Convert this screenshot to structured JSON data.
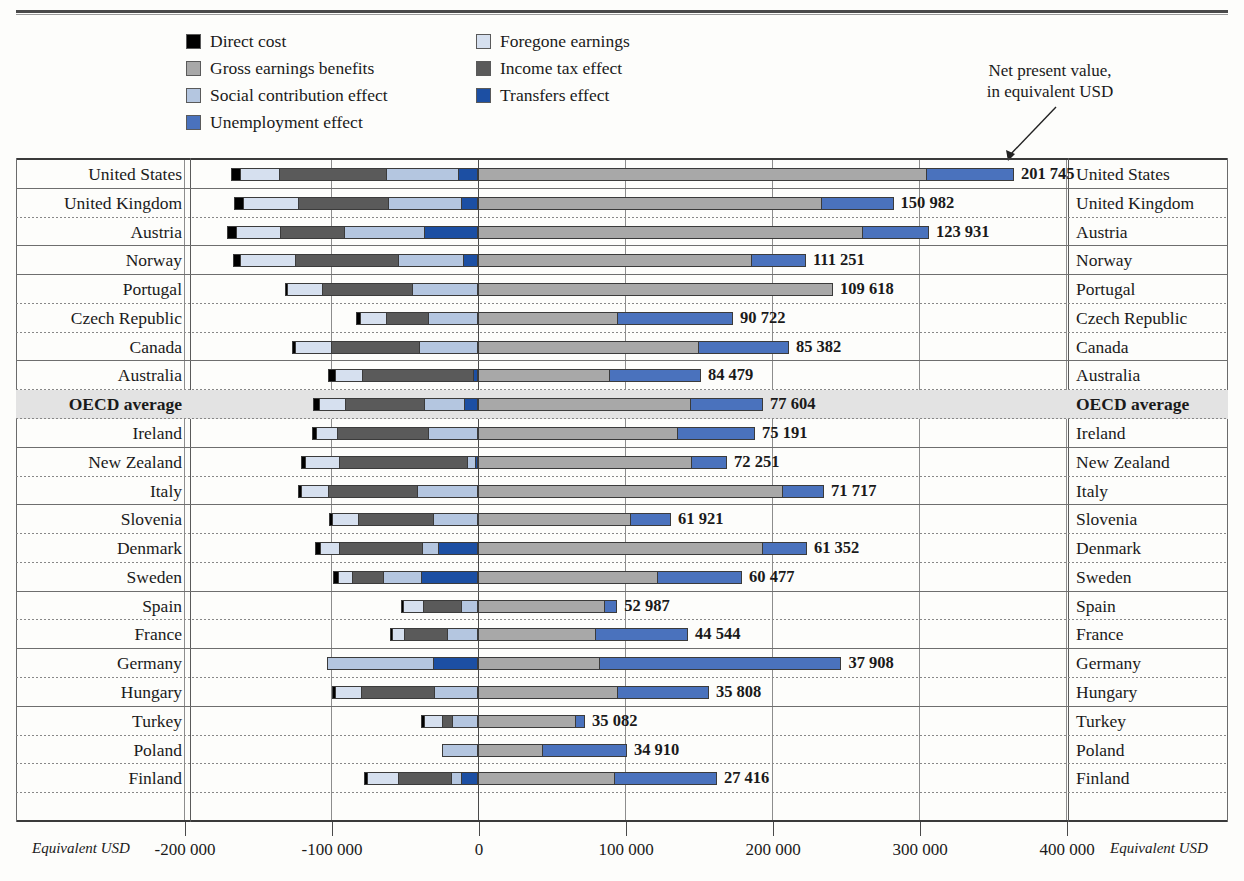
{
  "legend": {
    "items": [
      {
        "label": "Direct cost",
        "color": "#000000",
        "key": "direct_cost"
      },
      {
        "label": "Foregone earnings",
        "color": "#d6e0ef",
        "key": "foregone_earnings"
      },
      {
        "label": "Gross earnings benefits",
        "color": "#a8a8a8",
        "key": "gross_earnings_benefits"
      },
      {
        "label": "Income tax effect",
        "color": "#5a5a5a",
        "key": "income_tax_effect"
      },
      {
        "label": "Social contribution effect",
        "color": "#b4c6e0",
        "key": "social_contribution_effect"
      },
      {
        "label": "Transfers effect",
        "color": "#1c4fa3",
        "key": "transfers_effect"
      },
      {
        "label": "Unemployment effect",
        "color": "#4a72bd",
        "key": "unemployment_effect"
      }
    ]
  },
  "annotation": {
    "line1": "Net present value,",
    "line2": "in equivalent USD"
  },
  "axis": {
    "unit_left": "Equivalent USD",
    "unit_right": "Equivalent USD",
    "ticks": [
      "-200 000",
      "-100 000",
      "0",
      "100 000",
      "200 000",
      "300 000",
      "400 000"
    ],
    "tick_values": [
      -200000,
      -100000,
      0,
      100000,
      200000,
      300000,
      400000
    ]
  },
  "chart_data": {
    "type": "bar",
    "title": "",
    "xlabel": "Equivalent USD",
    "ylabel": "",
    "xlim": [
      -250000,
      430000
    ],
    "orientation": "horizontal",
    "stacked": true,
    "grid": true,
    "legend_position": "top",
    "categories": [
      "United States",
      "United Kingdom",
      "Austria",
      "Norway",
      "Portugal",
      "Czech Republic",
      "Canada",
      "Australia",
      "OECD average",
      "Ireland",
      "New Zealand",
      "Italy",
      "Slovenia",
      "Denmark",
      "Sweden",
      "Spain",
      "France",
      "Germany",
      "Hungary",
      "Turkey",
      "Poland",
      "Finland"
    ],
    "series": [
      {
        "name": "Transfers effect",
        "color": "#1c4fa3",
        "values": [
          -13600,
          -11500,
          -36600,
          -10200,
          0,
          0,
          0,
          0,
          -9500,
          0,
          -2000,
          0,
          0,
          -27200,
          -38800,
          0,
          0,
          -30600,
          0,
          0,
          0,
          -11600
        ]
      },
      {
        "name": "Social contribution effect",
        "color": "#b4c6e0",
        "values": [
          -62900,
          -60900,
          -91200,
          -54400,
          -44900,
          -33700,
          -39900,
          0,
          -36600,
          -33700,
          -7500,
          -41600,
          -30600,
          -38100,
          -64600,
          -11600,
          -21100,
          -102700,
          -29900,
          -17700,
          -24500,
          -18400
        ]
      },
      {
        "name": "Income tax effect",
        "color": "#5a5a5a",
        "values": [
          -135200,
          -122300,
          -134500,
          -124400,
          -106400,
          -62900,
          -99900,
          -78800,
          -90500,
          -95800,
          -94400,
          -102000,
          -81500,
          -94500,
          -85600,
          -37400,
          -50300,
          -68700,
          -79500,
          -24500,
          -9500,
          -54400
        ]
      },
      {
        "name": "Foregone earnings",
        "color": "#d6e0ef",
        "values": [
          -161600,
          -159600,
          -164300,
          -161600,
          -129700,
          -80200,
          -124400,
          -97200,
          -108400,
          -110400,
          -117700,
          -120400,
          -99300,
          -107800,
          -95100,
          -51000,
          -58500,
          -99300,
          -97200,
          -36700,
          -22500,
          -75400
        ]
      },
      {
        "name": "Direct cost",
        "color": "#000000",
        "values": [
          -168000,
          -166000,
          -170500,
          -166800,
          -131000,
          -82900,
          -126500,
          -102000,
          -112500,
          -113100,
          -120400,
          -122500,
          -101300,
          -111200,
          -98500,
          -52400,
          -60200,
          -102700,
          -99300,
          -38800,
          -24500,
          -77400
        ]
      },
      {
        "name": "Gross earnings benefits",
        "color": "#a8a8a8",
        "values": [
          305500,
          233700,
          261900,
          186400,
          241500,
          95200,
          150300,
          89800,
          144900,
          136100,
          145600,
          207500,
          104100,
          193900,
          122500,
          86600,
          80300,
          82900,
          95200,
          66700,
          44200,
          93100
        ]
      },
      {
        "name": "Unemployment effect",
        "color": "#4a72bd",
        "values": [
          64600,
          49000,
          44900,
          36700,
          0,
          78300,
          61200,
          61900,
          49000,
          52400,
          23800,
          27900,
          27200,
          29900,
          57100,
          8200,
          62600,
          164300,
          61900,
          6100,
          57100,
          69400
        ]
      }
    ],
    "net_values": [
      201745,
      150982,
      123931,
      111251,
      109618,
      90722,
      85382,
      84479,
      77604,
      75191,
      72251,
      71717,
      61921,
      61352,
      60477,
      52987,
      44544,
      37908,
      35808,
      35082,
      34910,
      27416
    ],
    "net_labels": [
      "201 745",
      "150 982",
      "123 931",
      "111 251",
      "109 618",
      "90 722",
      "85 382",
      "84 479",
      "77 604",
      "75 191",
      "72 251",
      "71 717",
      "61 921",
      "61 352",
      "60 477",
      "52 987",
      "44 544",
      "37 908",
      "35 808",
      "35 082",
      "34 910",
      "27 416"
    ],
    "highlight_category": "OECD average"
  },
  "rows": [
    {
      "label": "United States",
      "value": "201 745",
      "neg": [
        [
          "transfers",
          -13600
        ],
        [
          "social",
          -62900
        ],
        [
          "tax",
          -135200
        ],
        [
          "foregone",
          -161600
        ],
        [
          "direct",
          -168000
        ]
      ],
      "pos": [
        [
          "gross",
          305500
        ],
        [
          "unemp",
          364600
        ]
      ],
      "solid": true,
      "shaded": false,
      "bold": false
    },
    {
      "label": "United Kingdom",
      "value": "150 982",
      "neg": [
        [
          "transfers",
          -11500
        ],
        [
          "social",
          -60900
        ],
        [
          "tax",
          -122300
        ],
        [
          "foregone",
          -159600
        ],
        [
          "direct",
          -166000
        ]
      ],
      "pos": [
        [
          "gross",
          233700
        ],
        [
          "unemp",
          282700
        ]
      ],
      "solid": false,
      "shaded": false,
      "bold": false
    },
    {
      "label": "Austria",
      "value": "123 931",
      "neg": [
        [
          "transfers",
          -36600
        ],
        [
          "social",
          -91200
        ],
        [
          "tax",
          -134500
        ],
        [
          "foregone",
          -164300
        ],
        [
          "direct",
          -170500
        ]
      ],
      "pos": [
        [
          "gross",
          261900
        ],
        [
          "unemp",
          306800
        ]
      ],
      "solid": true,
      "shaded": false,
      "bold": false
    },
    {
      "label": "Norway",
      "value": "111 251",
      "neg": [
        [
          "transfers",
          -10200
        ],
        [
          "social",
          -54400
        ],
        [
          "tax",
          -124400
        ],
        [
          "foregone",
          -161600
        ],
        [
          "direct",
          -166800
        ]
      ],
      "pos": [
        [
          "gross",
          186400
        ],
        [
          "unemp",
          223100
        ]
      ],
      "solid": true,
      "shaded": false,
      "bold": false
    },
    {
      "label": "Portugal",
      "value": "109 618",
      "neg": [
        [
          "social",
          -44900
        ],
        [
          "tax",
          -106400
        ],
        [
          "foregone",
          -129700
        ],
        [
          "direct",
          -131000
        ]
      ],
      "pos": [
        [
          "gross",
          241500
        ]
      ],
      "solid": false,
      "shaded": false,
      "bold": false
    },
    {
      "label": "Czech Republic",
      "value": "90 722",
      "neg": [
        [
          "social",
          -33700
        ],
        [
          "tax",
          -62900
        ],
        [
          "foregone",
          -80200
        ],
        [
          "direct",
          -82900
        ]
      ],
      "pos": [
        [
          "gross",
          95200
        ],
        [
          "unemp",
          173500
        ]
      ],
      "solid": false,
      "shaded": false,
      "bold": false
    },
    {
      "label": "Canada",
      "value": "85 382",
      "neg": [
        [
          "social",
          -39900
        ],
        [
          "tax",
          -99900
        ],
        [
          "foregone",
          -124400
        ],
        [
          "direct",
          -126500
        ]
      ],
      "pos": [
        [
          "gross",
          150300
        ],
        [
          "unemp",
          211500
        ]
      ],
      "solid": true,
      "shaded": false,
      "bold": false
    },
    {
      "label": "Australia",
      "value": "84 479",
      "neg": [
        [
          "transfers",
          -3400
        ],
        [
          "tax",
          -78800
        ],
        [
          "foregone",
          -97200
        ],
        [
          "direct",
          -102000
        ]
      ],
      "pos": [
        [
          "gross",
          89800
        ],
        [
          "unemp",
          151700
        ]
      ],
      "solid": false,
      "shaded": false,
      "bold": false
    },
    {
      "label": "OECD average",
      "value": "77 604",
      "neg": [
        [
          "transfers",
          -9500
        ],
        [
          "social",
          -36600
        ],
        [
          "tax",
          -90500
        ],
        [
          "foregone",
          -108400
        ],
        [
          "direct",
          -112500
        ]
      ],
      "pos": [
        [
          "gross",
          144900
        ],
        [
          "unemp",
          193900
        ]
      ],
      "solid": false,
      "shaded": true,
      "bold": true
    },
    {
      "label": "Ireland",
      "value": "75 191",
      "neg": [
        [
          "social",
          -33700
        ],
        [
          "tax",
          -95800
        ],
        [
          "foregone",
          -110400
        ],
        [
          "direct",
          -113100
        ]
      ],
      "pos": [
        [
          "gross",
          136100
        ],
        [
          "unemp",
          188500
        ]
      ],
      "solid": true,
      "shaded": false,
      "bold": false
    },
    {
      "label": "New Zealand",
      "value": "72 251",
      "neg": [
        [
          "transfers",
          -2000
        ],
        [
          "social",
          -7500
        ],
        [
          "tax",
          -94400
        ],
        [
          "foregone",
          -117700
        ],
        [
          "direct",
          -120400
        ]
      ],
      "pos": [
        [
          "gross",
          145600
        ],
        [
          "unemp",
          169400
        ]
      ],
      "solid": false,
      "shaded": false,
      "bold": false
    },
    {
      "label": "Italy",
      "value": "71 717",
      "neg": [
        [
          "social",
          -41600
        ],
        [
          "tax",
          -102000
        ],
        [
          "foregone",
          -120400
        ],
        [
          "direct",
          -122500
        ]
      ],
      "pos": [
        [
          "gross",
          207500
        ],
        [
          "unemp",
          235400
        ]
      ],
      "solid": true,
      "shaded": false,
      "bold": false
    },
    {
      "label": "Slovenia",
      "value": "61 921",
      "neg": [
        [
          "social",
          -30600
        ],
        [
          "tax",
          -81500
        ],
        [
          "foregone",
          -99300
        ],
        [
          "direct",
          -101300
        ]
      ],
      "pos": [
        [
          "gross",
          104100
        ],
        [
          "unemp",
          131300
        ]
      ],
      "solid": false,
      "shaded": false,
      "bold": false
    },
    {
      "label": "Denmark",
      "value": "61 352",
      "neg": [
        [
          "transfers",
          -27200
        ],
        [
          "social",
          -38100
        ],
        [
          "tax",
          -94500
        ],
        [
          "foregone",
          -107800
        ],
        [
          "direct",
          -111200
        ]
      ],
      "pos": [
        [
          "gross",
          193900
        ],
        [
          "unemp",
          223800
        ]
      ],
      "solid": false,
      "shaded": false,
      "bold": false
    },
    {
      "label": "Sweden",
      "value": "60 477",
      "neg": [
        [
          "transfers",
          -38800
        ],
        [
          "social",
          -64600
        ],
        [
          "tax",
          -85600
        ],
        [
          "foregone",
          -95100
        ],
        [
          "direct",
          -98500
        ]
      ],
      "pos": [
        [
          "gross",
          122500
        ],
        [
          "unemp",
          179600
        ]
      ],
      "solid": true,
      "shaded": false,
      "bold": false
    },
    {
      "label": "Spain",
      "value": "52 987",
      "neg": [
        [
          "social",
          -11600
        ],
        [
          "tax",
          -37400
        ],
        [
          "foregone",
          -51000
        ],
        [
          "direct",
          -52400
        ]
      ],
      "pos": [
        [
          "gross",
          86600
        ],
        [
          "unemp",
          94800
        ]
      ],
      "solid": false,
      "shaded": false,
      "bold": false
    },
    {
      "label": "France",
      "value": "44 544",
      "neg": [
        [
          "social",
          -21100
        ],
        [
          "tax",
          -50300
        ],
        [
          "foregone",
          -58500
        ],
        [
          "direct",
          -60200
        ]
      ],
      "pos": [
        [
          "gross",
          80300
        ],
        [
          "unemp",
          142900
        ]
      ],
      "solid": true,
      "shaded": false,
      "bold": false
    },
    {
      "label": "Germany",
      "value": "37 908",
      "neg": [
        [
          "transfers",
          -30600
        ],
        [
          "social",
          -102700
        ],
        [
          "tax",
          -68700
        ],
        [
          "foregone",
          -99300
        ],
        [
          "direct",
          -102700
        ]
      ],
      "pos": [
        [
          "gross",
          82900
        ],
        [
          "unemp",
          247200
        ]
      ],
      "solid": false,
      "shaded": false,
      "bold": false
    },
    {
      "label": "Hungary",
      "value": "35 808",
      "neg": [
        [
          "social",
          -29900
        ],
        [
          "tax",
          -79500
        ],
        [
          "foregone",
          -97200
        ],
        [
          "direct",
          -99300
        ]
      ],
      "pos": [
        [
          "gross",
          95200
        ],
        [
          "unemp",
          157100
        ]
      ],
      "solid": true,
      "shaded": false,
      "bold": false
    },
    {
      "label": "Turkey",
      "value": "35 082",
      "neg": [
        [
          "social",
          -17700
        ],
        [
          "tax",
          -24500
        ],
        [
          "foregone",
          -36700
        ],
        [
          "direct",
          -38800
        ]
      ],
      "pos": [
        [
          "gross",
          66700
        ],
        [
          "unemp",
          72800
        ]
      ],
      "solid": false,
      "shaded": false,
      "bold": false
    },
    {
      "label": "Poland",
      "value": "34 910",
      "neg": [
        [
          "social",
          -24500
        ],
        [
          "tax",
          -9500
        ],
        [
          "foregone",
          -22500
        ],
        [
          "direct",
          -24500
        ]
      ],
      "pos": [
        [
          "gross",
          44200
        ],
        [
          "unemp",
          101300
        ]
      ],
      "solid": false,
      "shaded": false,
      "bold": false
    },
    {
      "label": "Finland",
      "value": "27 416",
      "neg": [
        [
          "transfers",
          -11600
        ],
        [
          "social",
          -18400
        ],
        [
          "tax",
          -54400
        ],
        [
          "foregone",
          -75400
        ],
        [
          "direct",
          -77400
        ]
      ],
      "pos": [
        [
          "gross",
          93100
        ],
        [
          "unemp",
          162500
        ]
      ],
      "solid": false,
      "shaded": false,
      "bold": false
    }
  ]
}
